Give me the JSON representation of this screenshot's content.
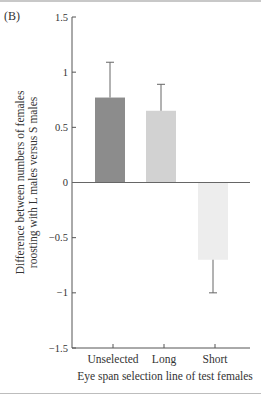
{
  "panel_label": "(B)",
  "chart_data": {
    "type": "bar",
    "title": "",
    "panel": "(B)",
    "categories": [
      "Unselected",
      "Long",
      "Short"
    ],
    "values": [
      0.77,
      0.65,
      -0.7
    ],
    "error_upper": [
      1.09,
      0.89,
      -1.0
    ],
    "bar_colors": [
      "#8c8c8c",
      "#d2d2d2",
      "#ededed"
    ],
    "xlabel": "Eye span selection line of test females",
    "ylabel_lines": [
      "Difference between numbers of females",
      "roosting with L males versus S males"
    ],
    "ylim": [
      -1.5,
      1.5
    ],
    "yticks": [
      1.5,
      1,
      0.5,
      0,
      -0.5,
      -1,
      -1.5
    ],
    "ytick_labels": [
      "1.5",
      "1",
      "0.5",
      "0",
      "−0.5",
      "−1",
      "−1.5"
    ],
    "grid": false,
    "legend": "none"
  }
}
